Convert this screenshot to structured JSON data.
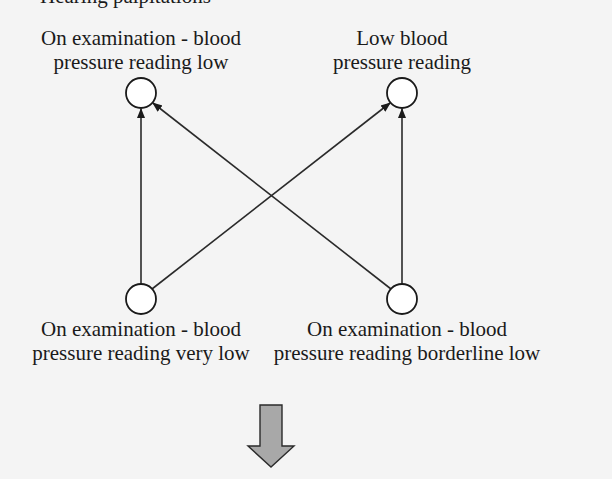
{
  "diagram": {
    "cropped_header": "Hearing palpitations",
    "nodes": [
      {
        "id": "top-left",
        "label_line1": "On examination - blood",
        "label_line2": "pressure reading low",
        "cx": 141,
        "cy": 93
      },
      {
        "id": "top-right",
        "label_line1": "Low blood",
        "label_line2": "pressure reading",
        "cx": 402,
        "cy": 93
      },
      {
        "id": "bottom-left",
        "label_line1": "On examination - blood",
        "label_line2": "pressure reading very low",
        "cx": 141,
        "cy": 299
      },
      {
        "id": "bottom-right",
        "label_line1": "On examination - blood",
        "label_line2": "pressure reading borderline low",
        "cx": 402,
        "cy": 299
      }
    ],
    "edges": [
      {
        "from": "bottom-left",
        "to": "top-left"
      },
      {
        "from": "bottom-left",
        "to": "top-right"
      },
      {
        "from": "bottom-right",
        "to": "top-left"
      },
      {
        "from": "bottom-right",
        "to": "top-right"
      }
    ],
    "down_arrow": {
      "color": "#a8a8a8"
    }
  }
}
